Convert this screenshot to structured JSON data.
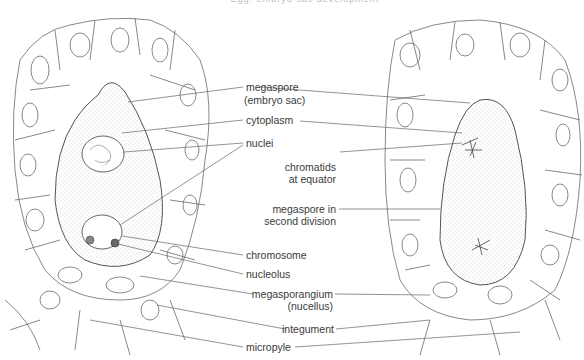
{
  "title": "Egg: embryo sac development",
  "labels": {
    "megaspore": "megaspore",
    "embryo_sac": "(embryo sac)",
    "cytoplasm": "cytoplasm",
    "nuclei": "nuclei",
    "chromatids_1": "chromatids",
    "chromatids_2": "at equator",
    "megaspore_div_1": "megaspore in",
    "megaspore_div_2": "second division",
    "chromosome": "chromosome",
    "nucleolus": "nucleolus",
    "megasporangium": "megasporangium",
    "nucellus": "(nucellus)",
    "integument": "integument",
    "micropyle": "micropyle"
  },
  "colors": {
    "line": "#555555",
    "stipple": "#9a9a9a",
    "text": "#3a3a3a"
  }
}
